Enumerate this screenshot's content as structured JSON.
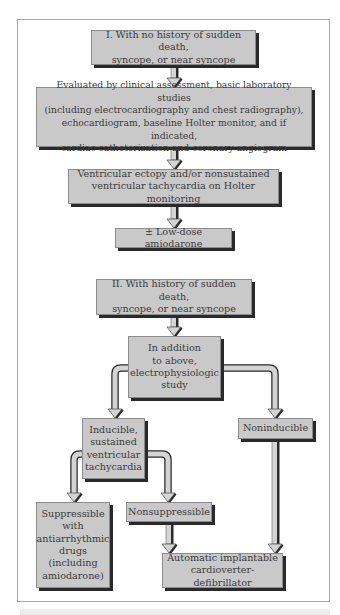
{
  "diagram": {
    "type": "flowchart",
    "colors": {
      "box_fill": "#c9c9c9",
      "box_border": "#8c8c8c",
      "box_shadow": "#2a2a2a",
      "arrow_fill": "#d4d4d4",
      "frame": "#a8a8a8",
      "text": "#3a3a3a"
    },
    "section1": {
      "header": "I. With no history of sudden death,\nsyncope, or near syncope",
      "evaluation": "Evaluated by clinical assessment, basic laboratory studies\n(including electrocardiography and chest radiography),\nechocardiogram, baseline Holter monitor, and if indicated,\ncardiac catheterization and coronary angiogram",
      "finding": "Ventricular ectopy and/or nonsustained\nventricular tachycardia on Holter monitoring",
      "treatment": "± Low-dose amiodarone"
    },
    "section2": {
      "header": "II. With history of sudden death,\nsyncope, or near syncope",
      "study": "In addition\nto above,\nelectrophysiologic\nstudy",
      "inducible": "Inducible,\nsustained\nventricular\ntachycardia",
      "noninducible": "Noninducible",
      "suppressible": "Suppressible\nwith\nantiarrhythmic\ndrugs\n(including\namiodarone)",
      "nonsuppressible": "Nonsuppressible",
      "icd": "Automatic implantable\ncardioverter-defibrillator"
    },
    "edges": [
      {
        "from": "section1.header",
        "to": "section1.evaluation"
      },
      {
        "from": "section1.evaluation",
        "to": "section1.finding"
      },
      {
        "from": "section1.finding",
        "to": "section1.treatment"
      },
      {
        "from": "section2.header",
        "to": "section2.study"
      },
      {
        "from": "section2.study",
        "to": "section2.inducible"
      },
      {
        "from": "section2.study",
        "to": "section2.noninducible"
      },
      {
        "from": "section2.inducible",
        "to": "section2.suppressible"
      },
      {
        "from": "section2.inducible",
        "to": "section2.nonsuppressible"
      },
      {
        "from": "section2.nonsuppressible",
        "to": "section2.icd"
      },
      {
        "from": "section2.noninducible",
        "to": "section2.icd"
      }
    ]
  }
}
